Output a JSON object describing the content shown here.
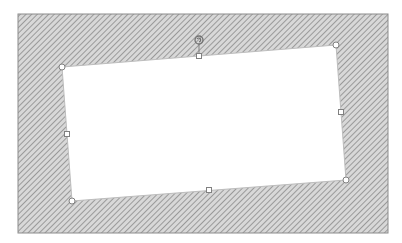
{
  "canvas": {
    "width": 402,
    "height": 243,
    "background": "#ffffff"
  },
  "slide": {
    "x": 18,
    "y": 14,
    "width": 370,
    "height": 219,
    "hatch_color": "#9a9a9a",
    "hatch_bg": "#d8d8d8",
    "border_color": "#8c8c8c"
  },
  "shape": {
    "type": "rotated-rectangle",
    "fill": "#ffffff",
    "stroke": "#bdbdbd",
    "vertices": {
      "top_left": [
        62,
        67
      ],
      "top_right": [
        336,
        45
      ],
      "bottom_right": [
        346,
        180
      ],
      "bottom_left": [
        72,
        201
      ]
    },
    "handles": {
      "top_mid": [
        199,
        56
      ],
      "right_mid": [
        341,
        112
      ],
      "bottom_mid": [
        209,
        190
      ],
      "left_mid": [
        67,
        134
      ]
    },
    "rotation_handle": [
      199,
      40
    ],
    "handle_fill": "#ffffff",
    "handle_stroke": "#808080"
  }
}
